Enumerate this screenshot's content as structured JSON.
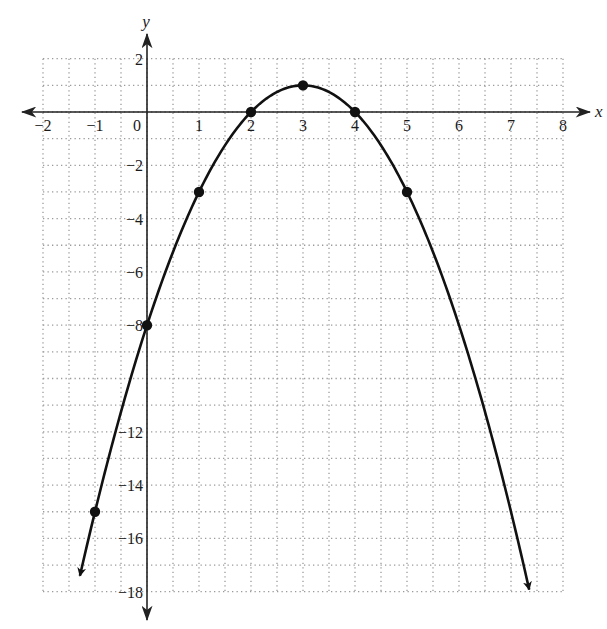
{
  "chart_data": {
    "type": "line",
    "title": "",
    "function": "y = -x^2 + 6x - 8",
    "xlabel": "x",
    "ylabel": "y",
    "xlim": [
      -2,
      8
    ],
    "ylim": [
      -18,
      2
    ],
    "grid": true,
    "x_grid_step": 0.5,
    "y_grid_step": 1,
    "x_ticks": [
      -2,
      -1,
      0,
      1,
      2,
      3,
      4,
      5,
      6,
      7,
      8
    ],
    "x_tick_labels": [
      "−2",
      "−1",
      "0",
      "1",
      "2",
      "3",
      "4",
      "5",
      "6",
      "7",
      "8"
    ],
    "y_ticks": [
      2,
      -2,
      -4,
      -6,
      -8,
      -12,
      -14,
      -16,
      -18
    ],
    "y_tick_labels": [
      "2",
      "−2",
      "−4",
      "−6",
      "−8",
      "−12",
      "−14",
      "−16",
      "−18"
    ],
    "points": [
      {
        "x": -1,
        "y": -15
      },
      {
        "x": 0,
        "y": -8
      },
      {
        "x": 1,
        "y": -3
      },
      {
        "x": 2,
        "y": 0
      },
      {
        "x": 3,
        "y": 1
      },
      {
        "x": 4,
        "y": 0
      },
      {
        "x": 5,
        "y": -3
      }
    ],
    "curve_x_range": [
      -1.29,
      7.35
    ],
    "curve_arrows": "both ends",
    "colors": {
      "curve": "#111111",
      "axes": "#222222",
      "grid": "#9a9a9a",
      "background": "#ffffff"
    }
  }
}
